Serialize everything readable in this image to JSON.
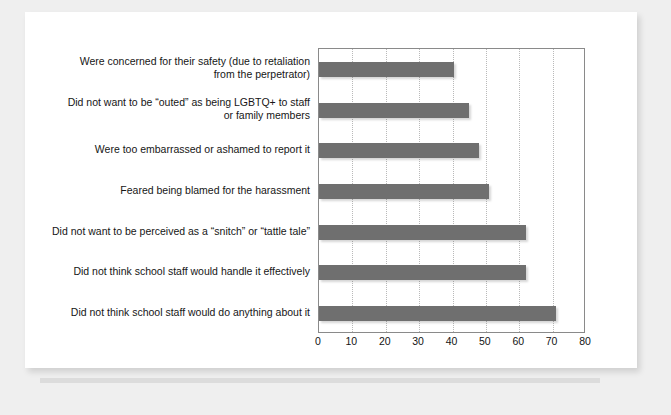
{
  "chart_data": {
    "type": "bar",
    "orientation": "horizontal",
    "title": "",
    "subtitle": "",
    "xlabel": "",
    "ylabel": "",
    "xlim": [
      0,
      80
    ],
    "xticks": [
      0,
      10,
      20,
      30,
      40,
      50,
      60,
      70,
      80
    ],
    "grid": "vertical-dotted",
    "legend": "none",
    "bar_color": "#6f6f6f",
    "plot_border_color": "#8a8a8a",
    "gridline_color": "#b9b9b9",
    "categories": [
      "Were concerned for their safety (due to retaliation from the perpetrator)",
      "Did not want to be “outed” as being LGBTQ+ to staff or family members",
      "Were too embarrassed or ashamed to report it",
      "Feared being blamed for the harassment",
      "Did not want to be perceived as a “snitch” or “tattle tale”",
      "Did not think school staff would handle it effectively",
      "Did not think school staff would do anything about it"
    ],
    "values": [
      40.5,
      45,
      48,
      51,
      62,
      62,
      71
    ],
    "category_lines": [
      [
        "Were concerned for their safety (due to retaliation",
        "from the perpetrator)"
      ],
      [
        "Did not want to be “outed” as being LGBTQ+ to staff",
        "or family members"
      ],
      [
        "Were too embarrassed or ashamed to report it"
      ],
      [
        "Feared being blamed for the harassment"
      ],
      [
        "Did not want to be perceived as a “snitch” or “tattle tale”"
      ],
      [
        "Did not think school staff would handle it effectively"
      ],
      [
        "Did not think school staff would do anything about it"
      ]
    ]
  },
  "page": {
    "background_color": "#efefef",
    "card_color": "#ffffff"
  }
}
